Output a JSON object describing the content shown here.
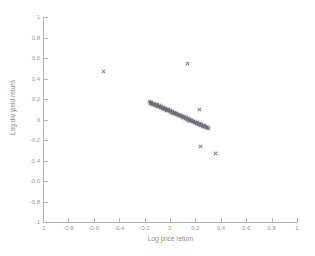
{
  "chart_data": {
    "type": "scatter",
    "title": "",
    "xlabel": "Log price return",
    "ylabel": "Log div yield return",
    "xlim": [
      -1,
      1
    ],
    "ylim": [
      -1,
      1
    ],
    "grid": false,
    "legend": null,
    "marker": "x",
    "marker_color": "#6e6e78",
    "xticks": [
      -1,
      -0.8,
      -0.6,
      -0.4,
      -0.2,
      0,
      0.2,
      0.4,
      0.6,
      0.8,
      1
    ],
    "yticks": [
      -1,
      -0.8,
      -0.6,
      -0.4,
      -0.2,
      0,
      0.2,
      0.4,
      0.6,
      0.8,
      1
    ],
    "xticklabels": [
      "-1",
      "-0.8",
      "-0.6",
      "-0.4",
      "-0.2",
      "0",
      "0.2",
      "0.4",
      "0.6",
      "0.8",
      "1"
    ],
    "yticklabels": [
      "-1",
      "-0.8",
      "-0.6",
      "-0.4",
      "-0.2",
      "0",
      "0.2",
      "0.4",
      "0.6",
      "0.8",
      "1"
    ],
    "series": [
      {
        "name": "observations",
        "points": [
          [
            -0.52,
            0.47
          ],
          [
            0.14,
            0.55
          ],
          [
            0.23,
            0.1
          ],
          [
            0.24,
            -0.26
          ],
          [
            0.36,
            -0.33
          ],
          [
            -0.16,
            0.175
          ],
          [
            -0.15,
            0.16
          ],
          [
            -0.142,
            0.168
          ],
          [
            -0.135,
            0.15
          ],
          [
            -0.128,
            0.158
          ],
          [
            -0.12,
            0.143
          ],
          [
            -0.112,
            0.15
          ],
          [
            -0.105,
            0.136
          ],
          [
            -0.098,
            0.142
          ],
          [
            -0.09,
            0.128
          ],
          [
            -0.083,
            0.133
          ],
          [
            -0.076,
            0.12
          ],
          [
            -0.068,
            0.126
          ],
          [
            -0.06,
            0.112
          ],
          [
            -0.053,
            0.118
          ],
          [
            -0.046,
            0.104
          ],
          [
            -0.038,
            0.11
          ],
          [
            -0.03,
            0.096
          ],
          [
            -0.023,
            0.101
          ],
          [
            -0.016,
            0.088
          ],
          [
            -0.008,
            0.093
          ],
          [
            0.0,
            0.08
          ],
          [
            0.007,
            0.085
          ],
          [
            0.014,
            0.072
          ],
          [
            0.022,
            0.077
          ],
          [
            0.03,
            0.063
          ],
          [
            0.037,
            0.068
          ],
          [
            0.044,
            0.055
          ],
          [
            0.052,
            0.06
          ],
          [
            0.06,
            0.046
          ],
          [
            0.067,
            0.051
          ],
          [
            0.074,
            0.038
          ],
          [
            0.082,
            0.043
          ],
          [
            0.09,
            0.029
          ],
          [
            0.097,
            0.034
          ],
          [
            0.104,
            0.021
          ],
          [
            0.112,
            0.026
          ],
          [
            0.12,
            0.012
          ],
          [
            0.127,
            0.017
          ],
          [
            0.134,
            0.004
          ],
          [
            0.142,
            0.009
          ],
          [
            0.15,
            -0.005
          ],
          [
            0.157,
            0.0
          ],
          [
            0.164,
            -0.013
          ],
          [
            0.172,
            -0.008
          ],
          [
            0.18,
            -0.022
          ],
          [
            0.187,
            -0.017
          ],
          [
            0.194,
            -0.03
          ],
          [
            0.202,
            -0.025
          ],
          [
            0.21,
            -0.039
          ],
          [
            0.217,
            -0.034
          ],
          [
            0.224,
            -0.047
          ],
          [
            0.232,
            -0.042
          ],
          [
            0.24,
            -0.056
          ],
          [
            0.247,
            -0.051
          ],
          [
            0.254,
            -0.064
          ],
          [
            0.262,
            -0.059
          ],
          [
            0.27,
            -0.073
          ],
          [
            0.277,
            -0.068
          ],
          [
            0.284,
            -0.081
          ],
          [
            0.292,
            -0.076
          ],
          [
            0.3,
            -0.09
          ],
          [
            -0.155,
            0.168
          ],
          [
            -0.147,
            0.155
          ],
          [
            -0.131,
            0.147
          ],
          [
            -0.115,
            0.139
          ],
          [
            -0.1,
            0.131
          ],
          [
            -0.085,
            0.123
          ],
          [
            -0.07,
            0.115
          ],
          [
            -0.055,
            0.107
          ],
          [
            -0.04,
            0.099
          ],
          [
            -0.025,
            0.091
          ],
          [
            -0.01,
            0.083
          ],
          [
            0.005,
            0.075
          ],
          [
            0.02,
            0.067
          ],
          [
            0.035,
            0.059
          ],
          [
            0.05,
            0.051
          ],
          [
            0.065,
            0.043
          ],
          [
            0.08,
            0.035
          ],
          [
            0.095,
            0.027
          ],
          [
            0.11,
            0.019
          ],
          [
            0.125,
            0.011
          ],
          [
            0.14,
            0.003
          ],
          [
            0.155,
            -0.005
          ],
          [
            0.17,
            -0.013
          ],
          [
            0.185,
            -0.021
          ],
          [
            0.2,
            -0.029
          ],
          [
            0.215,
            -0.037
          ],
          [
            0.23,
            -0.045
          ],
          [
            0.245,
            -0.053
          ],
          [
            0.26,
            -0.061
          ],
          [
            0.275,
            -0.069
          ],
          [
            0.29,
            -0.077
          ]
        ]
      }
    ]
  }
}
